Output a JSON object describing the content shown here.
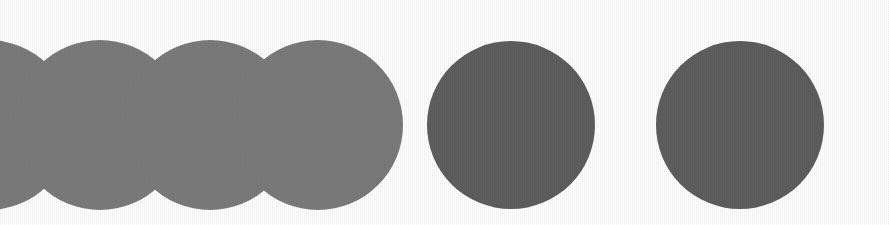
{
  "figure": {
    "title": "Overlapping circles diagram",
    "canvas": {
      "width": 889,
      "height": 225,
      "background_color": "#ffffff"
    },
    "style": {
      "circle_fill": "#5e5e5e",
      "overlap_fill": "#2a2a2a",
      "stroke": "none",
      "blend_mode": "multiply",
      "texture": "halftone-grain"
    },
    "geometry": {
      "radius": 85,
      "center_y": 125,
      "overlap_spacing": 109,
      "gap_spacing_5_to_6": 229
    },
    "circles": [
      {
        "id": "circle-0",
        "label": "Circle 0 (clipped at left edge)",
        "cx": -12,
        "cy": 125,
        "r": 85,
        "overlapping": true,
        "clipped": true
      },
      {
        "id": "circle-1",
        "label": "Circle 1",
        "cx": 100,
        "cy": 125,
        "r": 85,
        "overlapping": true,
        "clipped": false
      },
      {
        "id": "circle-2",
        "label": "Circle 2",
        "cx": 210,
        "cy": 125,
        "r": 85,
        "overlapping": true,
        "clipped": false
      },
      {
        "id": "circle-3",
        "label": "Circle 3",
        "cx": 318,
        "cy": 125,
        "r": 85,
        "overlapping": true,
        "clipped": false
      },
      {
        "id": "circle-4",
        "label": "Circle 4",
        "cx": 511,
        "cy": 125,
        "r": 84,
        "overlapping": false,
        "clipped": false
      },
      {
        "id": "circle-5",
        "label": "Circle 5",
        "cx": 740,
        "cy": 125,
        "r": 84,
        "overlapping": false,
        "clipped": false
      }
    ],
    "intersections": [
      {
        "id": "lens-0-1",
        "label": "Lens between circle 0 and circle 1",
        "between": [
          "circle-0",
          "circle-1"
        ]
      },
      {
        "id": "lens-1-2",
        "label": "Lens between circle 1 and circle 2",
        "between": [
          "circle-1",
          "circle-2"
        ]
      },
      {
        "id": "lens-2-3",
        "label": "Lens between circle 2 and circle 3",
        "between": [
          "circle-2",
          "circle-3"
        ]
      }
    ],
    "counts": {
      "total_circles": "6",
      "overlapping_circles": "4",
      "separate_circles": "2",
      "lens_regions": "3"
    }
  }
}
